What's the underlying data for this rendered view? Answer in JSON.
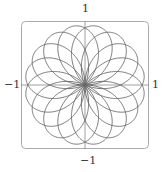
{
  "chart_data": {
    "type": "line",
    "subtype": "polar-rose",
    "title": "",
    "equation": "r = sin(8θ/5)",
    "theta_range": [
      0,
      31.4159
    ],
    "petals": 16,
    "xlabel": "",
    "ylabel": "",
    "xlim": [
      -1,
      1
    ],
    "ylim": [
      -1,
      1
    ],
    "tick_labels": {
      "top": "1",
      "bottom": "−1",
      "left": "−1",
      "right": "1"
    },
    "grid": false,
    "frame": "rounded-rectangle",
    "curve_color": "#666666",
    "axis_color": "#888888",
    "frame_color": "#aaaaaa"
  }
}
